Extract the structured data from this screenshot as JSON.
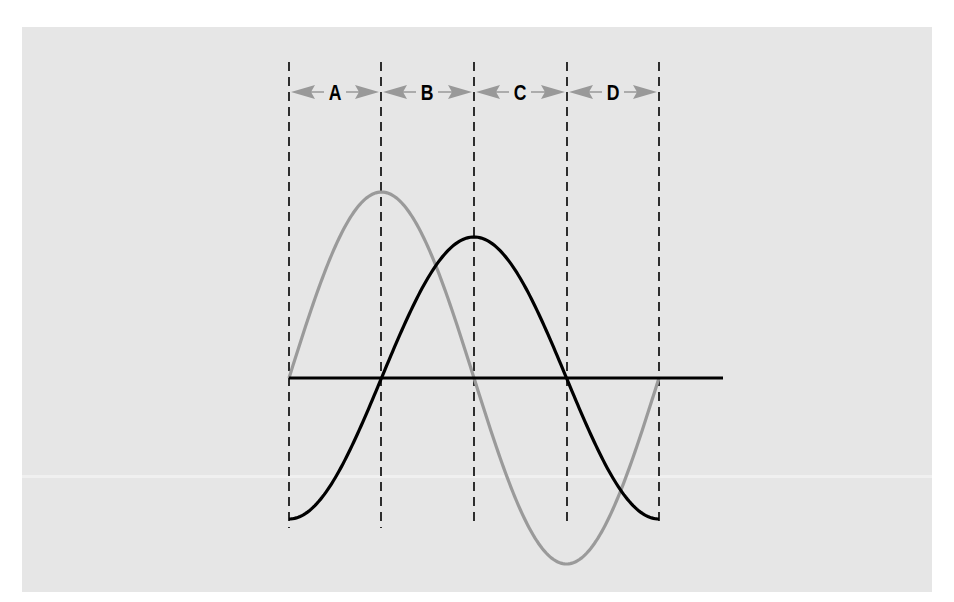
{
  "diagram": {
    "type": "phase-shifted waveforms",
    "intervals": [
      {
        "label": "A"
      },
      {
        "label": "B"
      },
      {
        "label": "C"
      },
      {
        "label": "D"
      }
    ],
    "waves": [
      {
        "name": "leading-wave",
        "color": "#9a9a9a",
        "shape": "sine",
        "relative_amplitude": 1.0
      },
      {
        "name": "lagging-wave",
        "color": "#000000",
        "shape": "negative-cosine",
        "relative_amplitude": 0.76
      }
    ],
    "colors": {
      "background": "#e6e6e6",
      "axis": "#000000",
      "arrows": "#999999",
      "dashed_lines": "#000000"
    }
  }
}
